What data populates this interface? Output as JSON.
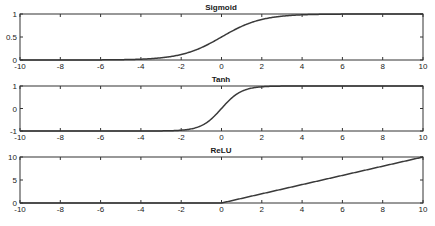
{
  "chart_data": [
    {
      "type": "line",
      "title": "Sigmoid",
      "function": "sigmoid",
      "xlabel": "",
      "ylabel": "",
      "xlim": [
        -10,
        10
      ],
      "ylim": [
        0,
        1
      ],
      "xticks": [
        -10,
        -8,
        -6,
        -4,
        -2,
        0,
        2,
        4,
        6,
        8,
        10
      ],
      "yticks": [
        0,
        0.5,
        1
      ],
      "ytick_labels": [
        "0",
        "0.5",
        "1"
      ],
      "grid": false,
      "legend": null,
      "series": [
        {
          "name": "sigmoid(x)",
          "x": [
            -10,
            -8,
            -6,
            -4,
            -3,
            -2,
            -1,
            0,
            1,
            2,
            3,
            4,
            6,
            8,
            10
          ],
          "y": [
            0.0,
            0.0003,
            0.0025,
            0.018,
            0.047,
            0.119,
            0.269,
            0.5,
            0.731,
            0.881,
            0.953,
            0.982,
            0.9975,
            0.9997,
            1.0
          ]
        }
      ]
    },
    {
      "type": "line",
      "title": "Tanh",
      "function": "tanh",
      "xlabel": "",
      "ylabel": "",
      "xlim": [
        -10,
        10
      ],
      "ylim": [
        -1,
        1
      ],
      "xticks": [
        -10,
        -8,
        -6,
        -4,
        -2,
        0,
        2,
        4,
        6,
        8,
        10
      ],
      "yticks": [
        -1,
        0,
        1
      ],
      "ytick_labels": [
        "-1",
        "0",
        "1"
      ],
      "grid": false,
      "legend": null,
      "series": [
        {
          "name": "tanh(x)",
          "x": [
            -10,
            -4,
            -3,
            -2,
            -1.5,
            -1,
            -0.5,
            0,
            0.5,
            1,
            1.5,
            2,
            3,
            4,
            10
          ],
          "y": [
            -1.0,
            -0.999,
            -0.995,
            -0.964,
            -0.905,
            -0.762,
            -0.462,
            0,
            0.462,
            0.762,
            0.905,
            0.964,
            0.995,
            0.999,
            1.0
          ]
        }
      ]
    },
    {
      "type": "line",
      "title": "ReLU",
      "function": "relu",
      "xlabel": "",
      "ylabel": "",
      "xlim": [
        -10,
        10
      ],
      "ylim": [
        0,
        10
      ],
      "xticks": [
        -10,
        -8,
        -6,
        -4,
        -2,
        0,
        2,
        4,
        6,
        8,
        10
      ],
      "yticks": [
        0,
        5,
        10
      ],
      "ytick_labels": [
        "0",
        "5",
        "10"
      ],
      "grid": false,
      "legend": null,
      "series": [
        {
          "name": "relu(x)",
          "x": [
            -10,
            0,
            10
          ],
          "y": [
            0,
            0,
            10
          ]
        }
      ]
    }
  ],
  "style": {
    "line_color": "#3a3a3a",
    "axes_color": "#333333",
    "text_color": "#1a1a1a",
    "background": "#ffffff"
  }
}
